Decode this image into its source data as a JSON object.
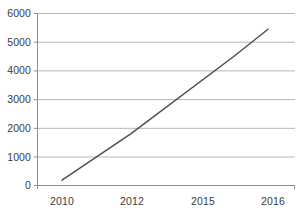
{
  "chart_data": {
    "type": "line",
    "title": "",
    "subtitle": "",
    "xlabel": "",
    "ylabel": "",
    "categories": [
      "2010",
      "2012",
      "2015",
      "2016"
    ],
    "x": [
      2010,
      2012,
      2015,
      2016
    ],
    "values": [
      190,
      1800,
      4500,
      5450
    ],
    "series": [
      {
        "name": "",
        "values": [
          190,
          1800,
          4500,
          5450
        ]
      }
    ],
    "ylim": [
      0,
      6000
    ],
    "ytick_labels": [
      "0",
      "1000",
      "2000",
      "3000",
      "4000",
      "5000",
      "6000"
    ],
    "ytick_values": [
      0,
      1000,
      2000,
      3000,
      4000,
      5000,
      6000
    ],
    "xtick_labels": [
      "2010",
      "2012",
      "2015",
      "2016"
    ],
    "grid": "horizontal",
    "legend": "none",
    "markers": "none",
    "colors": {
      "line": "#4a4a52",
      "grid": "#b7b7b7",
      "axis": "#8d8d8d",
      "text": "#3b3b3b",
      "background": "#ffffff"
    }
  },
  "axis": {
    "y_labels": [
      {
        "text": "6000",
        "value": 6000
      },
      {
        "text": "5000",
        "value": 5000
      },
      {
        "text": "4000",
        "value": 4000
      },
      {
        "text": "3000",
        "value": 3000
      },
      {
        "text": "2000",
        "value": 2000
      },
      {
        "text": "1000",
        "value": 1000
      },
      {
        "text": "0",
        "value": 0
      }
    ],
    "x_labels": [
      {
        "text": "2010",
        "value": 2010
      },
      {
        "text": "2012",
        "value": 2012
      },
      {
        "text": "2015",
        "value": 2015
      },
      {
        "text": "2016",
        "value": 2016
      }
    ]
  }
}
